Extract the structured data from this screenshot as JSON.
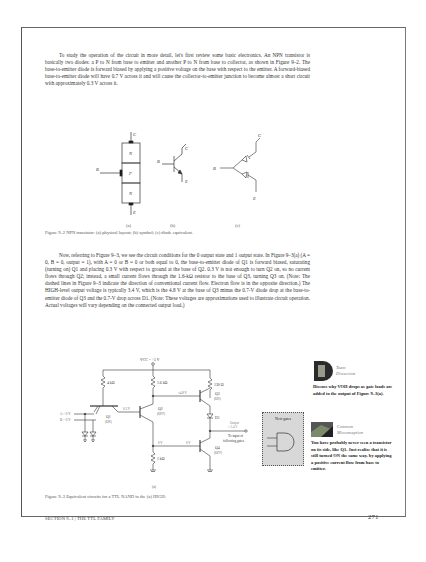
{
  "page": {
    "paragraph1": "To study the operation of the circuit in more detail, let's first review some basic electronics. An NPN transistor is basically two diodes: a P to N from base to emitter and another P to N from base to collector, as shown in Figure 9–2. The base-to-emitter diode is forward biased by applying a positive voltage on the base with respect to the emitter. A forward-biased base-to-emitter diode will have 0.7 V across it and will cause the collector-to-emitter junction to become almost a short circuit with approximately 0.3 V across it.",
    "paragraph2": "Now, referring to Figure 9–3, we see the circuit conditions for the 0 output state and 1 output state. In Figure 9–3(a) (A = 0, B = 0, output = 1), with A = 0 or B = 0 or both equal to 0, the base-to-emitter diode of Q1 is forward biased, saturating (turning on) Q1 and placing 0.3 V with respect to ground at the base of Q2. 0.3 V is not enough to turn Q2 on, so no current flows through Q2; instead, a small current flows through the 1.6-kΩ resistor to the base of Q3, turning Q3 on. (Note: The dashed lines in Figure 9–3 indicate the direction of conventional current flow. Electron flow is in the opposite direction.) The HIGH-level output voltage is typically 3.4 V, which is the 4.8 V at the base of Q3 minus the 0.7-V diode drop at the base-to-emitter diode of Q3 and the 0.7-V drop across D1. (Note: These voltages are approximations used to illustrate circuit operation. Actual voltages will vary depending on the connected output load.)",
    "figure2": {
      "caption": "Figure 9–2   NPN transistor: (a) physical layout; (b) symbol; (c) diode equivalent.",
      "labels": {
        "a": "(a)",
        "b": "(b)",
        "c": "(c)",
        "C": "C",
        "B": "B",
        "E": "E",
        "N": "N",
        "P": "P"
      }
    },
    "figure3": {
      "caption": "Figure 9–3   Equivalent circuits for a TTL NAND in the (a) HIGH;",
      "sublabel": "(a)",
      "vcc": "VCC = +5 V",
      "r1": "4 kΩ",
      "r2": "1.6 kΩ",
      "r3": "130 Ω",
      "r4": "1 kΩ",
      "inputA": "A = 0 V",
      "inputB": "B = 0 V",
      "q1": "Q1",
      "q1_state": "(ON)",
      "q2": "Q2",
      "q2_state": "(OFF)",
      "q3": "Q3",
      "q3_state": "(ON)",
      "q4": "Q4",
      "q4_state": "(OFF)",
      "d1": "D1",
      "v_q2_base": "0.3 V",
      "v_q3_base": "≈4.8 V",
      "v_q4_base1": "0 V",
      "v_q4_base2": "0 V",
      "output_label": "Output",
      "output_value": "≈ 3.4 V",
      "to_input": "To input of",
      "following_gates": "following gates",
      "next_gates": "Next gates",
      "current_marker": "I"
    },
    "sidebar1": {
      "icon": "team-discussion-icon",
      "title_line1": "Team",
      "title_line2": "Discussion",
      "body": "Discuss why VOH drops as gate loads are added to the output of Figure 9–3(a)."
    },
    "sidebar2": {
      "icon": "common-misconception-icon",
      "title_line1": "Common",
      "title_line2": "Misconception",
      "body": "You have probably never seen a transistor on its side, like Q1. Just realize that it is still turned ON the same way, by applying a positive current flow from base to emitter."
    },
    "footer": "SECTION 9–1  |  THE TTL FAMILY",
    "page_number": "271"
  }
}
